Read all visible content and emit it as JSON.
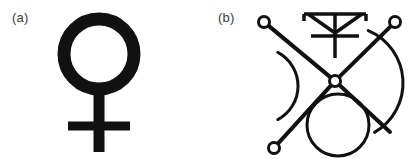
{
  "figure": {
    "background_color": "#ffffff",
    "ink_color": "#111111",
    "width": 416,
    "height": 159,
    "panels": [
      {
        "id": "panel-a",
        "label": "(a)",
        "symbol_name": "venus-female-symbol",
        "description": "Thick ring above a cross",
        "stroke_color": "#111111",
        "geometry": {
          "circle_center_x": 99,
          "circle_center_y": 54,
          "circle_radius": 35,
          "circle_stroke_width": 13,
          "stem_x": 99,
          "stem_top_y": 89,
          "stem_bottom_y": 152,
          "stem_width": 11,
          "crossbar_y": 126,
          "crossbar_left_x": 68,
          "crossbar_right_x": 130,
          "crossbar_height": 9
        }
      },
      {
        "id": "panel-b",
        "label": "(b)",
        "symbol_name": "composite-trident-cross-glyph",
        "description": "X-shaped cross with ringed endpoints, left and right crescent arcs, a circle at bottom center and a trident symbol above",
        "stroke_color": "#111111",
        "geometry": {
          "hub_x": 127,
          "hub_y": 81,
          "hub_outer_radius": 5.5,
          "hub_inner_radius": 2.4,
          "ray_stroke_width": 4,
          "endpoint_ring_radius": 5.5,
          "endpoint_ring_stroke_width": 3,
          "rays": [
            {
              "name": "ray-up-left",
              "end_x": 56,
              "end_y": 22,
              "has_ring": true
            },
            {
              "name": "ray-up-right",
              "end_x": 187,
              "end_y": 22,
              "has_ring": true
            },
            {
              "name": "ray-down-left",
              "end_x": 66,
              "end_y": 148,
              "has_ring": true
            },
            {
              "name": "ray-down-right",
              "end_x": 182,
              "end_y": 132,
              "has_ring": false
            }
          ],
          "left_arc": {
            "name": "left-crescent-arc",
            "center_x": 52,
            "center_y": 86,
            "radius": 38,
            "start_angle_deg": -62,
            "end_angle_deg": 62,
            "stroke_width": 3
          },
          "right_arc": {
            "name": "right-crescent-arc",
            "center_x": 138,
            "center_y": 83,
            "radius": 57,
            "start_angle_deg": -67,
            "end_angle_deg": 60,
            "stroke_width": 3
          },
          "bottom_circle": {
            "name": "bottom-circle",
            "center_x": 130,
            "center_y": 125,
            "radius": 31,
            "stroke_width": 3
          },
          "trident": {
            "name": "trident-symbol",
            "stem_x": 127,
            "stem_top_y": 14,
            "stem_bottom_y": 58,
            "top_bar_y": 14,
            "top_bar_left_x": 96,
            "top_bar_right_x": 158,
            "tick_depth": 7,
            "cross_bar_y": 36,
            "cross_bar_left_x": 103,
            "cross_bar_right_x": 151,
            "diagonal_left_from_x": 100,
            "diagonal_right_from_x": 154,
            "diagonal_to_y": 33,
            "stroke_width": 3.5
          }
        }
      }
    ]
  }
}
